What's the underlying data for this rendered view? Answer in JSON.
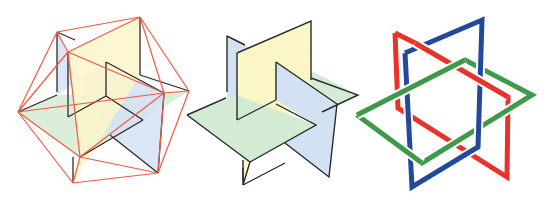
{
  "colors": {
    "background": "#ffffff",
    "yellow_plane": "#fbf6c8",
    "blue_plane": "#d3e2f3",
    "green_plane": "#d3ebd3",
    "plane_edge": "#2a2a2a",
    "icosa_edge": "#ee5a44",
    "ring_red": "#e8322a",
    "ring_blue": "#234a9a",
    "ring_green": "#3e9a48",
    "ring_gap": "#ffffff"
  },
  "figures": [
    {
      "id": "icosahedron",
      "planes": {
        "green": [
          [
            18,
            112
          ],
          [
            57,
            95
          ],
          [
            189,
            91
          ],
          [
            143,
            120
          ],
          [
            80,
            157
          ]
        ],
        "blue": [
          [
            57,
            32
          ],
          [
            57,
            95
          ],
          [
            106,
            62
          ],
          [
            164,
            93
          ],
          [
            158,
            173
          ],
          [
            110,
            135
          ]
        ],
        "yellow": [
          [
            68,
            52
          ],
          [
            140,
            17
          ],
          [
            140,
            75
          ],
          [
            73,
            183
          ],
          [
            80,
            157
          ]
        ]
      },
      "plane_edges": [
        [
          [
            57,
            32
          ],
          [
            57,
            92
          ]
        ],
        [
          [
            57,
            32
          ],
          [
            75,
            40
          ]
        ],
        [
          [
            68,
            52
          ],
          [
            68,
            117
          ]
        ],
        [
          [
            68,
            117
          ],
          [
            106,
            96
          ]
        ],
        [
          [
            106,
            62
          ],
          [
            106,
            96
          ]
        ],
        [
          [
            106,
            62
          ],
          [
            164,
            93
          ]
        ],
        [
          [
            164,
            93
          ],
          [
            158,
            173
          ]
        ],
        [
          [
            158,
            173
          ],
          [
            110,
            135
          ]
        ],
        [
          [
            106,
            96
          ],
          [
            143,
            120
          ]
        ],
        [
          [
            143,
            120
          ],
          [
            80,
            157
          ]
        ],
        [
          [
            140,
            17
          ],
          [
            140,
            75
          ]
        ],
        [
          [
            140,
            75
          ],
          [
            189,
            91
          ]
        ],
        [
          [
            18,
            112
          ],
          [
            57,
            95
          ]
        ],
        [
          [
            73,
            183
          ],
          [
            73,
            157
          ]
        ]
      ],
      "vertices": {
        "top": [
          140,
          17
        ],
        "upper_left": [
          57,
          32
        ],
        "inner_top": [
          68,
          52
        ],
        "left": [
          18,
          112
        ],
        "right": [
          189,
          91
        ],
        "inner_right": [
          164,
          93
        ],
        "inner_bottom": [
          80,
          157
        ],
        "bottom": [
          73,
          183
        ],
        "bottom_right": [
          158,
          173
        ]
      },
      "icosa_edges": [
        [
          "top",
          "upper_left"
        ],
        [
          "top",
          "inner_top"
        ],
        [
          "top",
          "right"
        ],
        [
          "top",
          "inner_right"
        ],
        [
          "upper_left",
          "inner_top"
        ],
        [
          "upper_left",
          "left"
        ],
        [
          "inner_top",
          "left"
        ],
        [
          "inner_top",
          "inner_right"
        ],
        [
          "inner_top",
          "inner_bottom"
        ],
        [
          "left",
          "inner_bottom"
        ],
        [
          "left",
          "bottom"
        ],
        [
          "right",
          "inner_right"
        ],
        [
          "right",
          "bottom_right"
        ],
        [
          "inner_right",
          "inner_bottom"
        ],
        [
          "inner_right",
          "bottom_right"
        ],
        [
          "inner_bottom",
          "bottom"
        ],
        [
          "inner_bottom",
          "bottom_right"
        ],
        [
          "bottom",
          "bottom_right"
        ],
        [
          "left",
          "inner_right"
        ]
      ]
    },
    {
      "id": "three-golden-rectangles",
      "planes": {
        "blue_back": [
          [
            227,
            36
          ],
          [
            276,
            62
          ],
          [
            276,
            100
          ],
          [
            227,
            100
          ]
        ],
        "green_back": [
          [
            276,
            100
          ],
          [
            310,
            70
          ],
          [
            358,
            95
          ],
          [
            310,
            118
          ]
        ],
        "yellow": [
          [
            237,
            53
          ],
          [
            311,
            21
          ],
          [
            311,
            85
          ],
          [
            250,
            162
          ],
          [
            243,
            185
          ],
          [
            243,
            120
          ],
          [
            237,
            120
          ]
        ],
        "green_front": [
          [
            187,
            115
          ],
          [
            237,
            95
          ],
          [
            316,
            125
          ],
          [
            250,
            162
          ]
        ],
        "blue_front": [
          [
            276,
            62
          ],
          [
            337,
            104
          ],
          [
            329,
            177
          ],
          [
            285,
            143
          ],
          [
            316,
            125
          ],
          [
            276,
            100
          ]
        ]
      },
      "outlines": [
        [
          [
            227,
            36
          ],
          [
            227,
            92
          ]
        ],
        [
          [
            227,
            36
          ],
          [
            245,
            45
          ]
        ],
        [
          [
            237,
            53
          ],
          [
            311,
            21
          ],
          [
            311,
            80
          ]
        ],
        [
          [
            237,
            53
          ],
          [
            237,
            120
          ]
        ],
        [
          [
            237,
            120
          ],
          [
            276,
            100
          ]
        ],
        [
          [
            276,
            62
          ],
          [
            276,
            100
          ]
        ],
        [
          [
            276,
            62
          ],
          [
            337,
            104
          ],
          [
            329,
            177
          ],
          [
            285,
            143
          ]
        ],
        [
          [
            311,
            78
          ],
          [
            358,
            95
          ],
          [
            322,
            112
          ]
        ],
        [
          [
            187,
            115
          ],
          [
            226,
            98
          ]
        ],
        [
          [
            187,
            115
          ],
          [
            250,
            162
          ],
          [
            316,
            125
          ],
          [
            276,
            104
          ]
        ],
        [
          [
            250,
            162
          ],
          [
            243,
            185
          ],
          [
            243,
            168
          ]
        ],
        [
          [
            243,
            185
          ],
          [
            285,
            163
          ]
        ],
        [
          [
            243,
            160
          ],
          [
            243,
            180
          ]
        ]
      ]
    },
    {
      "id": "borromean-rectangles",
      "rings": {
        "red": [
          [
            395,
            33
          ],
          [
            415,
            43
          ],
          [
            508,
            97
          ],
          [
            507,
            177
          ],
          [
            398,
            108
          ],
          [
            395,
            33
          ]
        ],
        "blue": [
          [
            405,
            53
          ],
          [
            482,
            20
          ],
          [
            478,
            147
          ],
          [
            412,
            187
          ],
          [
            405,
            53
          ]
        ],
        "green": [
          [
            357,
            115
          ],
          [
            465,
            60
          ],
          [
            532,
            95
          ],
          [
            422,
            163
          ],
          [
            357,
            115
          ]
        ]
      },
      "stroke_width": 5
    }
  ]
}
